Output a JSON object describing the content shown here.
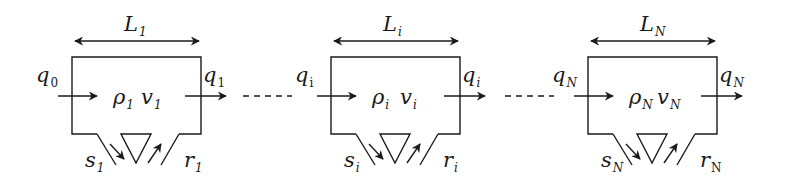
{
  "diagram": {
    "colors": {
      "line": "#1a1a1a",
      "background": "#ffffff"
    },
    "segments": [
      {
        "id": "segment-1",
        "x": 72,
        "length_label": "L",
        "length_sub": "1",
        "inflow_label": "q",
        "inflow_sub": "0",
        "inflow_sub_upright": true,
        "outflow_label": "q",
        "outflow_sub": "1",
        "outflow_sub_upright": true,
        "density_label": "ρ",
        "density_sub": "1",
        "speed_label": "v",
        "speed_sub": "1",
        "offramp_label": "s",
        "offramp_sub": "1",
        "onramp_label": "r",
        "onramp_sub": "1"
      },
      {
        "id": "segment-i",
        "x": 331,
        "length_label": "L",
        "length_sub": "i",
        "inflow_label": "q",
        "inflow_sub": "i",
        "inflow_sub_upright": true,
        "outflow_label": "q",
        "outflow_sub": "i",
        "outflow_sub_upright": false,
        "density_label": "ρ",
        "density_sub": "i",
        "speed_label": "v",
        "speed_sub": "i",
        "offramp_label": "s",
        "offramp_sub": "i",
        "onramp_label": "r",
        "onramp_sub": "i"
      },
      {
        "id": "segment-N",
        "x": 588,
        "length_label": "L",
        "length_sub": "N",
        "inflow_label": "q",
        "inflow_sub": "N",
        "inflow_sub_upright": false,
        "outflow_label": "q",
        "outflow_sub": "N",
        "outflow_sub_upright": false,
        "density_label": "ρ",
        "density_sub": "N",
        "speed_label": "v",
        "speed_sub": "N",
        "offramp_label": "s",
        "offramp_sub": "N",
        "onramp_label": "r",
        "onramp_sub": "N",
        "onramp_sub_upright": true
      }
    ],
    "connectors": [
      {
        "id": "dash-1-i",
        "x1": 243,
        "x2": 292,
        "y": 96
      },
      {
        "id": "dash-i-N",
        "x1": 505,
        "x2": 554,
        "y": 96
      }
    ]
  }
}
